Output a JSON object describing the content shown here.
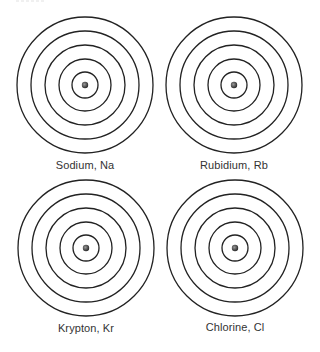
{
  "diagram": {
    "type": "bohr-model-shells",
    "shell_count": 5,
    "line_color": "#222222",
    "nucleus_color": "#444444",
    "atoms": [
      {
        "name": "Sodium",
        "symbol": "Na",
        "label": "Sodium, Na"
      },
      {
        "name": "Rubidium",
        "symbol": "Rb",
        "label": "Rubidium, Rb"
      },
      {
        "name": "Krypton",
        "symbol": "Kr",
        "label": "Krypton, Kr"
      },
      {
        "name": "Chlorine",
        "symbol": "Cl",
        "label": "Chlorine, Cl"
      }
    ]
  }
}
